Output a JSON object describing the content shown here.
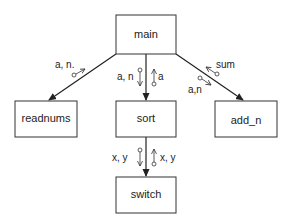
{
  "diagram": {
    "type": "structure-chart",
    "modules": [
      {
        "id": "main",
        "label": "main"
      },
      {
        "id": "readnums",
        "label": "readnums"
      },
      {
        "id": "sort",
        "label": "sort"
      },
      {
        "id": "add_n",
        "label": "add_n"
      },
      {
        "id": "switch",
        "label": "switch"
      }
    ],
    "calls": [
      {
        "from": "main",
        "to": "readnums",
        "params_down": "a, n.",
        "params_up": ""
      },
      {
        "from": "main",
        "to": "sort",
        "params_down": "a, n",
        "params_up": "a"
      },
      {
        "from": "main",
        "to": "add_n",
        "params_down": "a,n",
        "params_up": "sum"
      },
      {
        "from": "sort",
        "to": "switch",
        "params_down": "x, y",
        "params_up": "x, y"
      }
    ],
    "colors": {
      "line": "#222222",
      "background": "#ffffff"
    }
  }
}
